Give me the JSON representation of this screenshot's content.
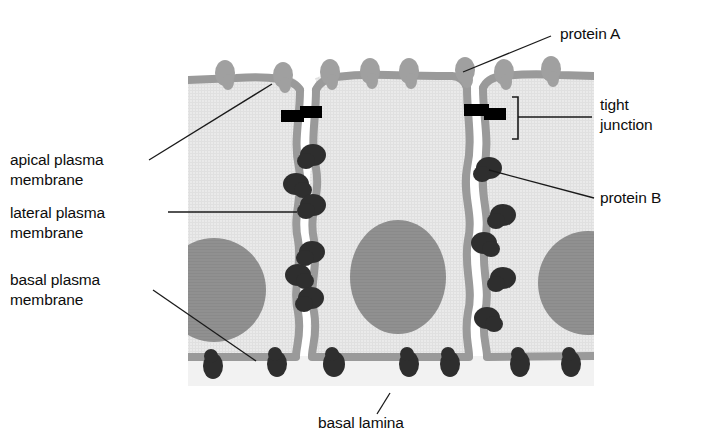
{
  "figure": {
    "colors": {
      "cytoplasm": "#e9e9e9",
      "cytoplasm_texture": "#dcdcdc",
      "membrane": "#9a9a9a",
      "nucleus": "#8f8f8f",
      "protein_a": "#9e9e9e",
      "protein_b": "#2b2b2b",
      "tight_junction": "#000000",
      "basal_lamina": "#f0f0f0",
      "leader_line": "#1a1a1a",
      "text": "#0d0d0d"
    }
  },
  "labels": {
    "apical_plasma_membrane": "apical plasma\nmembrane",
    "lateral_plasma_membrane": "lateral plasma\nmembrane",
    "basal_plasma_membrane": "basal plasma\nmembrane",
    "protein_a": "protein A",
    "protein_b": "protein B",
    "tight_junction": "tight\njunction",
    "basal_lamina": "basal lamina"
  },
  "diagram_data": {
    "type": "diagram",
    "cells": [
      {
        "name": "cell-left",
        "x_left": 188,
        "x_right": 300,
        "partial": true
      },
      {
        "name": "cell-center",
        "x_left": 310,
        "x_right": 468,
        "partial": false
      },
      {
        "name": "cell-right",
        "x_left": 478,
        "x_right": 594,
        "partial": true
      }
    ],
    "apical_y": 72,
    "basal_y": 358,
    "basal_lamina_y": [
      358,
      386
    ],
    "protein_a_positions_x": [
      225,
      282,
      330,
      370,
      408,
      465,
      505,
      550
    ],
    "protein_a_count": 8,
    "protein_b_lateral_count": 10,
    "protein_b_basal_count": 7,
    "tight_junction_positions_x": [
      305,
      473
    ],
    "tight_junction_y": 117,
    "nucleus_count": 3
  }
}
